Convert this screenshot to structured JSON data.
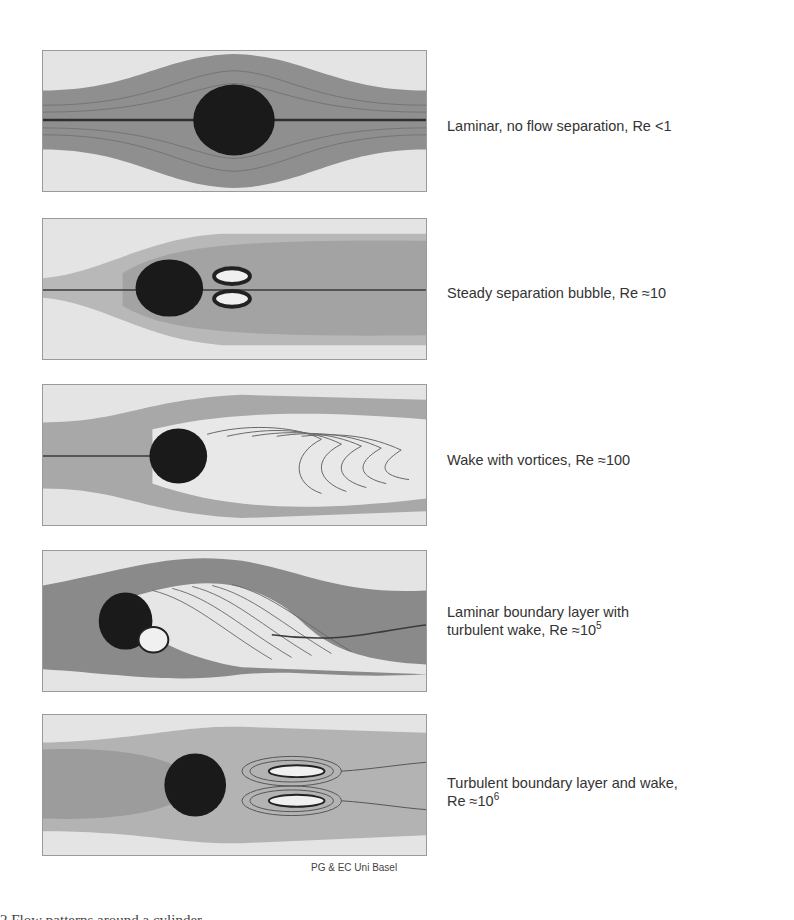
{
  "figure": {
    "type": "flow-regimes-around-cylinder",
    "panels": [
      {
        "id": "p1",
        "label": "Laminar, no flow separation, Re <1",
        "label_lines": [
          "Laminar, no flow separation, Re <1"
        ],
        "re_exp": null
      },
      {
        "id": "p2",
        "label": "Steady separation bubble, Re ≈10",
        "label_lines": [
          "Steady separation bubble, Re ≈10"
        ],
        "re_exp": null
      },
      {
        "id": "p3",
        "label": "Wake with vortices, Re ≈100",
        "label_lines": [
          "Wake with vortices, Re ≈100"
        ],
        "re_exp": null
      },
      {
        "id": "p4",
        "label": "Laminar boundary layer with turbulent wake, Re ≈10^5",
        "label_lines": [
          "Laminar boundary layer with",
          "turbulent wake, Re ≈10"
        ],
        "re_exp": "5"
      },
      {
        "id": "p5",
        "label": "Turbulent boundary layer and wake, Re ≈10^6",
        "label_lines": [
          "Turbulent boundary layer and wake,",
          "Re ≈10"
        ],
        "re_exp": "6"
      }
    ],
    "credit": "PG & EC Uni Basel",
    "caption_partial": "2  Flow patterns around a cylinder"
  },
  "colors": {
    "background": "#ffffff",
    "panel_bg": "#e4e4e4",
    "flow_band": "#8a8a8a",
    "cylinder": "#1a1a1a",
    "streamline": "#555555",
    "text": "#333333"
  }
}
